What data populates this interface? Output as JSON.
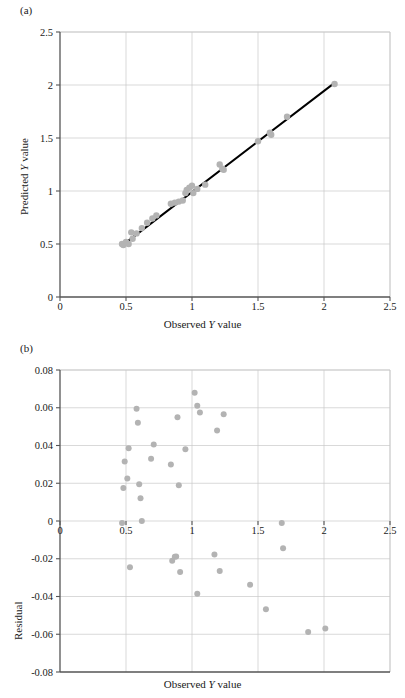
{
  "figure": {
    "panels": [
      {
        "id": "a",
        "label": "(a)"
      },
      {
        "id": "b",
        "label": "(b)"
      }
    ]
  },
  "panel_a": {
    "label": "(a)",
    "annotation": "RMSE = 0.04 (4%)",
    "xlabel_pre": "Observed ",
    "xlabel_ital": "Y",
    "xlabel_post": " value",
    "ylabel_pre": "Predicted ",
    "ylabel_ital": "Y",
    "ylabel_post": " value"
  },
  "panel_b": {
    "label": "(b)",
    "xlabel_pre": "Observed ",
    "xlabel_ital": "Y",
    "xlabel_post": " value",
    "ylabel": "Residual"
  },
  "style": {
    "marker_color": "#b3b3b3",
    "line_color": "#000000",
    "grid_color": "#c8c8c8",
    "axis_color": "#555555"
  },
  "chart_data": [
    {
      "type": "scatter",
      "panel": "a",
      "title": "",
      "xlabel": "Observed Y value",
      "ylabel": "Predicted Y value",
      "xlim": [
        0,
        2.5
      ],
      "ylim": [
        0,
        2.5
      ],
      "xticks": [
        0,
        0.5,
        1,
        1.5,
        2,
        2.5
      ],
      "yticks": [
        0,
        0.5,
        1,
        1.5,
        2,
        2.5
      ],
      "xticklabels": [
        "0",
        "0.5",
        "1",
        "1.5",
        "2",
        "2.5"
      ],
      "yticklabels": [
        "0",
        "0.5",
        "1",
        "1.5",
        "2",
        "2.5"
      ],
      "grid": true,
      "legend": null,
      "annotations": [
        {
          "text": "RMSE = 0.04 (4%)",
          "x": 0.27,
          "y": 2.02
        }
      ],
      "fit_line": {
        "x": [
          0.47,
          2.08
        ],
        "y": [
          0.485,
          2.02
        ]
      },
      "points": [
        {
          "x": 0.47,
          "y": 0.5
        },
        {
          "x": 0.48,
          "y": 0.49
        },
        {
          "x": 0.5,
          "y": 0.52
        },
        {
          "x": 0.52,
          "y": 0.5
        },
        {
          "x": 0.54,
          "y": 0.61
        },
        {
          "x": 0.55,
          "y": 0.55
        },
        {
          "x": 0.58,
          "y": 0.6
        },
        {
          "x": 0.62,
          "y": 0.65
        },
        {
          "x": 0.66,
          "y": 0.7
        },
        {
          "x": 0.7,
          "y": 0.74
        },
        {
          "x": 0.73,
          "y": 0.77
        },
        {
          "x": 0.84,
          "y": 0.88
        },
        {
          "x": 0.87,
          "y": 0.89
        },
        {
          "x": 0.9,
          "y": 0.9
        },
        {
          "x": 0.93,
          "y": 0.91
        },
        {
          "x": 0.95,
          "y": 0.98
        },
        {
          "x": 0.96,
          "y": 1.01
        },
        {
          "x": 0.98,
          "y": 1.03
        },
        {
          "x": 1.0,
          "y": 1.05
        },
        {
          "x": 1.01,
          "y": 0.98
        },
        {
          "x": 1.04,
          "y": 1.02
        },
        {
          "x": 1.1,
          "y": 1.06
        },
        {
          "x": 1.21,
          "y": 1.25
        },
        {
          "x": 1.23,
          "y": 1.21
        },
        {
          "x": 1.24,
          "y": 1.2
        },
        {
          "x": 1.5,
          "y": 1.47
        },
        {
          "x": 1.59,
          "y": 1.55
        },
        {
          "x": 1.6,
          "y": 1.53
        },
        {
          "x": 1.72,
          "y": 1.7
        },
        {
          "x": 2.08,
          "y": 2.01
        }
      ]
    },
    {
      "type": "scatter",
      "panel": "b",
      "title": "",
      "xlabel": "Observed Y value",
      "ylabel": "Residual",
      "xlim": [
        0,
        2.5
      ],
      "ylim": [
        -0.08,
        0.08
      ],
      "xticks": [
        0,
        0.5,
        1,
        1.5,
        2,
        2.5
      ],
      "yticks": [
        -0.08,
        -0.06,
        -0.04,
        -0.02,
        0,
        0.02,
        0.04,
        0.06,
        0.08
      ],
      "xticklabels": [
        "0",
        "0.5",
        "1",
        "1.5",
        "2",
        "2.5"
      ],
      "yticklabels": [
        "-0.08",
        "-0.06",
        "-0.04",
        "-0.02",
        "0",
        "0.02",
        "0.04",
        "0.06",
        "0.08"
      ],
      "grid": true,
      "legend": null,
      "annotations": [],
      "points": [
        {
          "x": 0.47,
          "y": -0.001
        },
        {
          "x": 0.48,
          "y": 0.0175
        },
        {
          "x": 0.49,
          "y": 0.0315
        },
        {
          "x": 0.51,
          "y": 0.0225
        },
        {
          "x": 0.52,
          "y": 0.0385
        },
        {
          "x": 0.53,
          "y": -0.0245
        },
        {
          "x": 0.58,
          "y": 0.0595
        },
        {
          "x": 0.59,
          "y": 0.052
        },
        {
          "x": 0.6,
          "y": 0.0195
        },
        {
          "x": 0.61,
          "y": 0.012
        },
        {
          "x": 0.62,
          "y": 0.0
        },
        {
          "x": 0.69,
          "y": 0.033
        },
        {
          "x": 0.71,
          "y": 0.0405
        },
        {
          "x": 0.84,
          "y": 0.03
        },
        {
          "x": 0.85,
          "y": -0.021
        },
        {
          "x": 0.87,
          "y": -0.019
        },
        {
          "x": 0.88,
          "y": -0.0188
        },
        {
          "x": 0.89,
          "y": 0.055
        },
        {
          "x": 0.9,
          "y": 0.019
        },
        {
          "x": 0.91,
          "y": -0.027
        },
        {
          "x": 0.95,
          "y": 0.038
        },
        {
          "x": 1.02,
          "y": 0.068
        },
        {
          "x": 1.04,
          "y": 0.061
        },
        {
          "x": 1.04,
          "y": -0.0385
        },
        {
          "x": 1.06,
          "y": 0.0575
        },
        {
          "x": 1.17,
          "y": -0.0178
        },
        {
          "x": 1.19,
          "y": 0.048
        },
        {
          "x": 1.21,
          "y": -0.0265
        },
        {
          "x": 1.24,
          "y": 0.0565
        },
        {
          "x": 1.44,
          "y": -0.0338
        },
        {
          "x": 1.56,
          "y": -0.0468
        },
        {
          "x": 1.68,
          "y": -0.001
        },
        {
          "x": 1.69,
          "y": -0.0145
        },
        {
          "x": 1.88,
          "y": -0.0588
        },
        {
          "x": 2.01,
          "y": -0.057
        }
      ]
    }
  ]
}
